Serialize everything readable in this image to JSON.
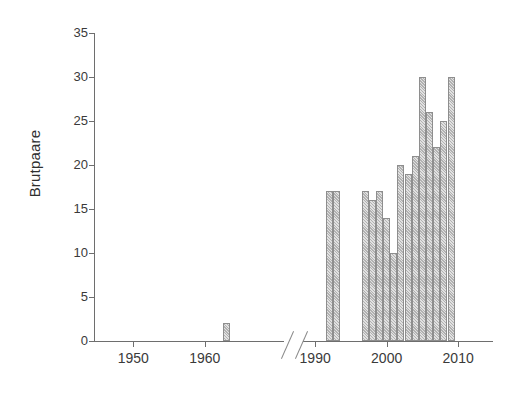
{
  "chart_data": {
    "type": "bar",
    "title": "",
    "subtitle": "",
    "xlabel": "",
    "ylabel": "Brutpaare",
    "ylim": [
      0,
      35
    ],
    "y_ticks": [
      0,
      5,
      10,
      15,
      20,
      25,
      30,
      35
    ],
    "x_ticks": [
      1950,
      1960,
      1990,
      2000,
      2010
    ],
    "x_axis_break": true,
    "x_axis_break_note": "axis break between 1965 and 1989",
    "grid": false,
    "legend": null,
    "bar_color": "#bdbdbd",
    "bar_edge_color": "#8e8e8e",
    "axis_color": "#6e6e6e",
    "text_color": "#3a3a3a",
    "categories": [
      1963,
      1992,
      1993,
      1997,
      1998,
      1999,
      2000,
      2001,
      2002,
      2003,
      2004,
      2005,
      2006,
      2007,
      2008,
      2009
    ],
    "values": [
      2,
      17,
      17,
      17,
      16,
      17,
      14,
      10,
      20,
      19,
      21,
      30,
      26,
      22,
      25,
      30
    ],
    "points": [
      {
        "year": 1963,
        "value": 2
      },
      {
        "year": 1992,
        "value": 17
      },
      {
        "year": 1993,
        "value": 17
      },
      {
        "year": 1997,
        "value": 17
      },
      {
        "year": 1998,
        "value": 16
      },
      {
        "year": 1999,
        "value": 17
      },
      {
        "year": 2000,
        "value": 14
      },
      {
        "year": 2001,
        "value": 10
      },
      {
        "year": 2002,
        "value": 20
      },
      {
        "year": 2003,
        "value": 19
      },
      {
        "year": 2004,
        "value": 21
      },
      {
        "year": 2005,
        "value": 30
      },
      {
        "year": 2006,
        "value": 26
      },
      {
        "year": 2007,
        "value": 22
      },
      {
        "year": 2008,
        "value": 25
      },
      {
        "year": 2009,
        "value": 30
      }
    ]
  },
  "axes": {
    "y_title": "Brutpaare",
    "y_labels": [
      "0",
      "5",
      "10",
      "15",
      "20",
      "25",
      "30",
      "35"
    ],
    "x_labels": [
      "1950",
      "1960",
      "1990",
      "2000",
      "2010"
    ]
  }
}
